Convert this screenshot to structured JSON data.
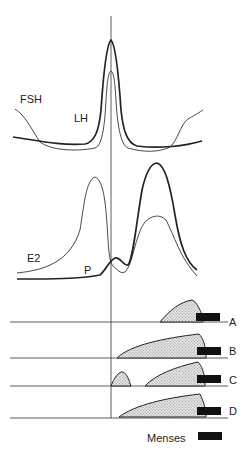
{
  "figure": {
    "page_number": "",
    "hormone_labels": {
      "fsh": "FSH",
      "lh": "LH",
      "e2": "E2",
      "p": "P"
    },
    "rows": [
      {
        "id": "A",
        "label": "A"
      },
      {
        "id": "B",
        "label": "B"
      },
      {
        "id": "C",
        "label": "C"
      },
      {
        "id": "D",
        "label": "D"
      }
    ],
    "legend": {
      "menses_label": "Menses"
    },
    "colors": {
      "ink": "#222222",
      "fill_stipple": "#cfcfcf",
      "menses_block": "#111111"
    }
  }
}
